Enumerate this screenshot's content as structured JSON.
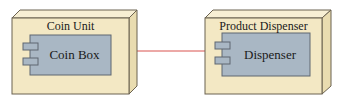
{
  "diagram": {
    "type": "UML deployment diagram",
    "nodes": [
      {
        "id": "coin-unit",
        "label": "Coin Unit",
        "component": {
          "label": "Coin Box"
        }
      },
      {
        "id": "product-dispenser",
        "label": "Product Dispenser",
        "component": {
          "label": "Dispenser"
        }
      }
    ],
    "connections": [
      {
        "from": "coin-unit",
        "to": "product-dispenser"
      }
    ],
    "colors": {
      "node_fill": "#f3e8c4",
      "node_top": "#f7efd4",
      "node_side": "#e9dcb0",
      "node_stroke": "#6b6250",
      "component_fill": "#a9b7c4",
      "component_stroke": "#5f6670",
      "connector": "#d9534f"
    }
  }
}
